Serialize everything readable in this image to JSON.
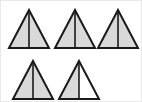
{
  "figure": {
    "background_color": "#ffffff",
    "border_color": "#e9e9e9",
    "outline_color": "#1a1a1a",
    "divider_color": "#1a1a1a",
    "shaded_fill": "#d9d9d9",
    "unshaded_fill": "#ffffff",
    "outline_width": 2,
    "divider_width": 1.6,
    "total_shapes": 5,
    "rows": 2,
    "row_counts": [
      3,
      2
    ],
    "shaded_halves": 9,
    "total_halves": 10,
    "fraction_label": "4 1/2",
    "shapes": [
      {
        "id": "triangle-1",
        "row": 1,
        "column": 1,
        "apex_x": 28,
        "apex_y": 9,
        "left_x": 8,
        "right_x": 48,
        "base_y": 47,
        "left_half_shaded": true,
        "right_half_shaded": true,
        "state": "fully-shaded"
      },
      {
        "id": "triangle-2",
        "row": 1,
        "column": 2,
        "apex_x": 74,
        "apex_y": 9,
        "left_x": 54,
        "right_x": 94,
        "base_y": 47,
        "left_half_shaded": true,
        "right_half_shaded": true,
        "state": "fully-shaded"
      },
      {
        "id": "triangle-3",
        "row": 1,
        "column": 3,
        "apex_x": 117,
        "apex_y": 9,
        "left_x": 97,
        "right_x": 137,
        "base_y": 47,
        "left_half_shaded": true,
        "right_half_shaded": true,
        "state": "fully-shaded"
      },
      {
        "id": "triangle-4",
        "row": 2,
        "column": 1,
        "apex_x": 32,
        "apex_y": 60,
        "left_x": 12,
        "right_x": 52,
        "base_y": 98,
        "left_half_shaded": true,
        "right_half_shaded": true,
        "state": "fully-shaded"
      },
      {
        "id": "triangle-5",
        "row": 2,
        "column": 2,
        "apex_x": 78,
        "apex_y": 60,
        "left_x": 58,
        "right_x": 98,
        "base_y": 98,
        "left_half_shaded": true,
        "right_half_shaded": false,
        "state": "half-shaded"
      }
    ]
  }
}
